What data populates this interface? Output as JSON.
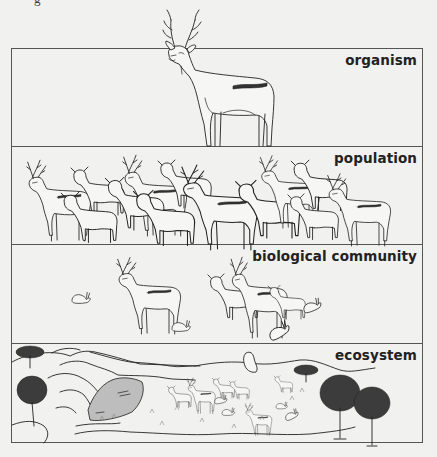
{
  "figure": {
    "page_fragment": "g",
    "colors": {
      "background": "#f1f1ef",
      "line": "#222222",
      "frame": "#555555",
      "rock": "#bdbdbd"
    },
    "panels": [
      {
        "label": "organism",
        "depiction": "single standing deer (buck) with antlers"
      },
      {
        "label": "population",
        "depiction": "herd of deer (bucks and does) standing together"
      },
      {
        "label": "biological community",
        "depiction": "deer of several sizes together with rabbits"
      },
      {
        "label": "ecosystem",
        "depiction": "landscape with hills, trees, shaded rock, grass, deer, rabbits and a bird"
      }
    ]
  }
}
